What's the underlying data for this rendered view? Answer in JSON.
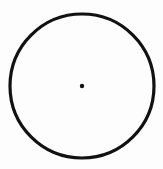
{
  "diagram": {
    "type": "circle-with-center",
    "width": 163,
    "height": 169,
    "background": "#fdfdfd",
    "circle": {
      "cx": 82,
      "cy": 86,
      "r": 72,
      "stroke": "#111111",
      "stroke_width": 3.2,
      "fill": "none"
    },
    "center_point": {
      "cx": 82,
      "cy": 86,
      "r": 2.2,
      "fill": "#111111"
    }
  }
}
